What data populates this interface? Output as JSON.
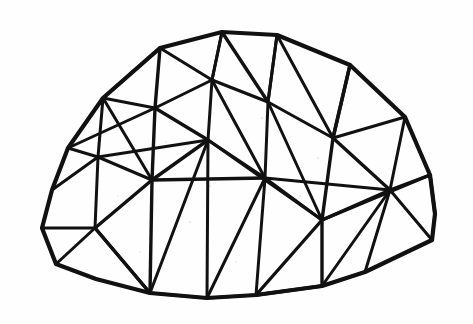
{
  "figure": {
    "title": "Geodesic Dome",
    "medium": "hand-drawn ink line sketch",
    "alt_text": "Hand-drawn line sketch of a hemispherical geodesic dome made of triangular struts",
    "caption": "",
    "width": 473,
    "height": 324
  },
  "style": {
    "background_color": "#fefefe",
    "stroke_color": "#111111",
    "fill_color": "none",
    "speckle_color": "#cfcfcf",
    "outline_stroke_width": 4.2,
    "major_stroke_width": 3.4,
    "minor_stroke_width": 3.0
  },
  "geometry": {
    "apex": {
      "x": 222,
      "y": 32
    },
    "silhouette": [
      {
        "x": 222,
        "y": 32
      },
      {
        "x": 277,
        "y": 35
      },
      {
        "x": 350,
        "y": 65
      },
      {
        "x": 405,
        "y": 117
      },
      {
        "x": 430,
        "y": 175
      },
      {
        "x": 435,
        "y": 214
      },
      {
        "x": 432,
        "y": 240
      },
      {
        "x": 365,
        "y": 272
      },
      {
        "x": 322,
        "y": 286
      },
      {
        "x": 256,
        "y": 295
      },
      {
        "x": 207,
        "y": 298
      },
      {
        "x": 150,
        "y": 293
      },
      {
        "x": 96,
        "y": 279
      },
      {
        "x": 56,
        "y": 264
      },
      {
        "x": 42,
        "y": 228
      },
      {
        "x": 52,
        "y": 190
      },
      {
        "x": 68,
        "y": 148
      },
      {
        "x": 103,
        "y": 98
      },
      {
        "x": 160,
        "y": 48
      }
    ],
    "inner_vertices": [
      {
        "id": "v_top_left",
        "x": 160,
        "y": 48
      },
      {
        "id": "v_top_right",
        "x": 277,
        "y": 35
      },
      {
        "id": "v_ring1_l",
        "x": 155,
        "y": 108
      },
      {
        "id": "v_ring1_c",
        "x": 212,
        "y": 80
      },
      {
        "id": "v_ring1_r",
        "x": 268,
        "y": 102
      },
      {
        "id": "v_ring1_rr",
        "x": 333,
        "y": 138
      },
      {
        "id": "v_ring2_ll",
        "x": 98,
        "y": 157
      },
      {
        "id": "v_ring2_l",
        "x": 152,
        "y": 180
      },
      {
        "id": "v_ring2_c",
        "x": 208,
        "y": 140
      },
      {
        "id": "v_ring2_r",
        "x": 265,
        "y": 178
      },
      {
        "id": "v_ring2_rr",
        "x": 390,
        "y": 190
      },
      {
        "id": "v_ring3_ll",
        "x": 95,
        "y": 228
      },
      {
        "id": "v_ring3_l",
        "x": 150,
        "y": 293
      },
      {
        "id": "v_ring3_c",
        "x": 207,
        "y": 298
      },
      {
        "id": "v_ring3_r",
        "x": 256,
        "y": 295
      },
      {
        "id": "v_ring3_rr",
        "x": 322,
        "y": 220
      }
    ],
    "strut_count": 63,
    "triangle_count": 40,
    "ring_count": 4
  },
  "paths": {
    "outline": "M222,32 L277,35 L350,65 L405,117 L430,175 L435,214 L432,240 L365,272 L322,286 L256,295 L207,298 L150,293 L96,279 L56,264 L42,228 L52,190 L68,148 L103,98 L160,48 Z",
    "struts": [
      "M160,48 L155,108",
      "M222,32 L212,80",
      "M277,35 L268,102",
      "M350,65 L333,138",
      "M103,98 L155,108",
      "M155,108 L212,80",
      "M212,80 L268,102",
      "M268,102 L333,138",
      "M333,138 L405,117",
      "M103,98 L160,48",
      "M160,48 L212,80",
      "M212,80 L222,32",
      "M222,32 L268,102",
      "M268,102 L277,35",
      "M277,35 L333,138",
      "M333,138 L350,65",
      "M68,148 L98,157",
      "M98,157 L152,180",
      "M152,180 L208,140",
      "M208,140 L265,178",
      "M265,178 L322,220",
      "M322,220 L390,190",
      "M390,190 L430,175",
      "M98,157 L103,98",
      "M155,108 L152,180",
      "M208,140 L212,80",
      "M265,178 L268,102",
      "M333,138 L322,220",
      "M390,190 L405,117",
      "M103,98 L152,180",
      "M155,108 L208,140",
      "M212,80 L265,178",
      "M268,102 L322,220",
      "M333,138 L390,190",
      "M68,148 L155,108",
      "M98,157 L208,140",
      "M152,180 L265,178",
      "M208,140 L322,220",
      "M265,178 L390,190",
      "M322,220 L430,175",
      "M52,190 L98,157",
      "M42,228 L95,228",
      "M95,228 L150,293",
      "M150,293 L207,298",
      "M207,298 L256,295",
      "M256,295 L322,286",
      "M322,286 L365,272",
      "M95,228 L98,157",
      "M152,180 L150,293",
      "M208,140 L207,298",
      "M265,178 L256,295",
      "M322,220 L322,286",
      "M390,190 L365,272",
      "M390,190 L432,240",
      "M95,228 L152,180",
      "M150,293 L208,140",
      "M207,298 L265,178",
      "M256,295 L322,220",
      "M322,286 L390,190",
      "M56,264 L95,228",
      "M95,228 L150,293",
      "M42,228 L56,264",
      "M435,214 L432,240",
      "M430,175 L435,214"
    ]
  },
  "speckles": [
    {
      "x": 262,
      "y": 118,
      "r": 0.8
    },
    {
      "x": 318,
      "y": 158,
      "r": 0.7
    },
    {
      "x": 190,
      "y": 222,
      "r": 0.8
    },
    {
      "x": 140,
      "y": 252,
      "r": 0.6
    },
    {
      "x": 300,
      "y": 196,
      "r": 0.7
    },
    {
      "x": 92,
      "y": 134,
      "r": 0.7
    },
    {
      "x": 356,
      "y": 232,
      "r": 0.8
    },
    {
      "x": 236,
      "y": 262,
      "r": 0.6
    },
    {
      "x": 402,
      "y": 212,
      "r": 0.7
    },
    {
      "x": 118,
      "y": 196,
      "r": 0.6
    },
    {
      "x": 74,
      "y": 244,
      "r": 0.7
    },
    {
      "x": 292,
      "y": 248,
      "r": 0.6
    },
    {
      "x": 166,
      "y": 142,
      "r": 0.6
    },
    {
      "x": 344,
      "y": 104,
      "r": 0.6
    },
    {
      "x": 210,
      "y": 186,
      "r": 0.7
    }
  ]
}
